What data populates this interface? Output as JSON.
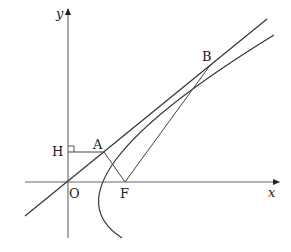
{
  "diagram": {
    "type": "geometry",
    "axes": {
      "x_label": "x",
      "y_label": "y",
      "origin_label": "O"
    },
    "points": {
      "O": {
        "label": "O",
        "px": [
          68,
          182
        ]
      },
      "A": {
        "label": "A",
        "px": [
          104,
          152
        ]
      },
      "B": {
        "label": "B",
        "px": [
          211,
          64
        ]
      },
      "F": {
        "label": "F",
        "px": [
          125,
          182
        ]
      },
      "H": {
        "label": "H",
        "px": [
          68,
          152
        ]
      }
    },
    "segments": [
      "AH",
      "AF",
      "BF"
    ],
    "lines": [
      "line OAB"
    ],
    "curves": [
      "parabola opening right, vertex near x-axis, focus F"
    ],
    "marks": [
      "right-angle mark at H"
    ],
    "colors": {
      "stroke": "#333333",
      "axis": "#555555",
      "text": "#222222"
    }
  }
}
